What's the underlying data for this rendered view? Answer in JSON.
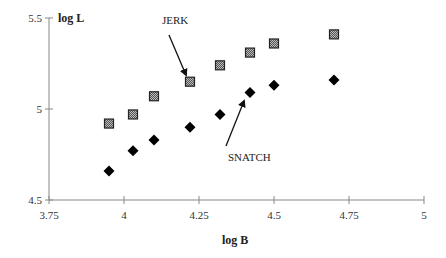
{
  "chart_data": {
    "type": "scatter",
    "title": "",
    "xlabel": "log B",
    "ylabel": "log L",
    "xlim": [
      3.75,
      5
    ],
    "ylim": [
      4.5,
      5.5
    ],
    "xticks": [
      3.75,
      4,
      4.25,
      4.5,
      4.75,
      5
    ],
    "xtick_labels": [
      "3.75",
      "4",
      "4.25",
      "4.5",
      "4.75",
      "5"
    ],
    "yticks": [
      4.5,
      5,
      5.5
    ],
    "ytick_labels": [
      "4.5",
      "5",
      "5.5"
    ],
    "grid": false,
    "legend": "none",
    "series": [
      {
        "name": "JERK",
        "marker": "square",
        "color": "#333333",
        "x": [
          3.95,
          4.03,
          4.1,
          4.22,
          4.32,
          4.42,
          4.5,
          4.7
        ],
        "y": [
          4.92,
          4.97,
          5.07,
          5.15,
          5.24,
          5.31,
          5.36,
          5.41
        ]
      },
      {
        "name": "SNATCH",
        "marker": "diamond",
        "color": "#000000",
        "x": [
          3.95,
          4.03,
          4.1,
          4.22,
          4.32,
          4.42,
          4.5,
          4.7
        ],
        "y": [
          4.66,
          4.77,
          4.83,
          4.9,
          4.97,
          5.09,
          5.13,
          5.16
        ]
      }
    ],
    "annotations": [
      {
        "text": "JERK",
        "label_x": 162,
        "label_y": 24,
        "arrow_from": [
          169,
          35
        ],
        "arrow_to": [
          186,
          75
        ]
      },
      {
        "text": "SNATCH",
        "label_x": 228,
        "label_y": 161,
        "arrow_from": [
          226,
          146
        ],
        "arrow_to": [
          244,
          101
        ]
      }
    ]
  }
}
